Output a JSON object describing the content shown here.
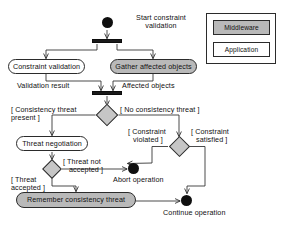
{
  "diagram": {
    "type": "uml-activity-diagram",
    "colors": {
      "middleware_fill": "#b9b9b9",
      "application_fill": "#ffffff",
      "decision_fill": "#c6c6c6",
      "stroke": "#2b2b2b",
      "node_solid": "#0f0f0f",
      "background": "#ffffff"
    },
    "legend": {
      "middleware_label": "Middleware",
      "application_label": "Application"
    },
    "nodes": {
      "start": {
        "kind": "initial-node",
        "label": "Start constraint\nvalidation",
        "label_line1": "Start constraint",
        "label_line2": "validation"
      },
      "fork1": {
        "kind": "fork-bar"
      },
      "constraint_validation": {
        "kind": "action",
        "label": "Constraint validation",
        "layer": "Application"
      },
      "gather_affected_objects": {
        "kind": "action",
        "label": "Gather affected objects",
        "layer": "Middleware"
      },
      "join1": {
        "kind": "join-bar"
      },
      "decision1": {
        "kind": "decision-node"
      },
      "threat_negotiation": {
        "kind": "action",
        "label": "Threat negotiation",
        "layer": "Application"
      },
      "decision2": {
        "kind": "decision-node"
      },
      "decision3": {
        "kind": "decision-node"
      },
      "remember_consistency_threat": {
        "kind": "action",
        "label": "Remember consistency threat",
        "layer": "Middleware"
      },
      "abort": {
        "kind": "final-node",
        "label": "Abort operation"
      },
      "continue": {
        "kind": "final-node",
        "label": "Continue operation"
      }
    },
    "flow_labels": {
      "validation_result": "Validation result",
      "affected_objects": "Affected objects"
    },
    "guards": {
      "consistency_threat_present_line1": "[ Consistency threat",
      "consistency_threat_present_line2": "present ]",
      "no_consistency_threat": "[ No consistency threat ]",
      "constraint_violated_line1": "[ Constraint",
      "constraint_violated_line2": "violated ]",
      "constraint_satisfied_line1": "[ Constraint",
      "constraint_satisfied_line2": "satisfied ]",
      "threat_not_accepted_line1": "[ Threat not",
      "threat_not_accepted_line2": "accepted ]",
      "threat_accepted_line1": "[ Threat",
      "threat_accepted_line2": "accepted ]"
    }
  }
}
